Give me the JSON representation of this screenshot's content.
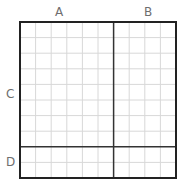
{
  "diagram": {
    "type": "area-grid",
    "labels": {
      "top_left": "A",
      "top_right": "B",
      "side_upper": "C",
      "side_lower": "D"
    },
    "grid": {
      "origin_x": 20,
      "origin_y": 22,
      "cell_size": 15.6,
      "columns_a": 6,
      "columns_b": 4,
      "rows_c": 8,
      "rows_d": 2
    },
    "colors": {
      "grid_line": "#d8d8d8",
      "divider_line": "#333333",
      "border": "#222222",
      "label": "#6e6e6e"
    }
  }
}
